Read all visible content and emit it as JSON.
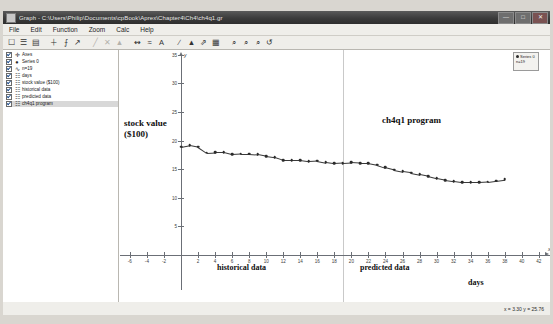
{
  "window": {
    "title": "Graph - C:\\Users\\Philip\\Documents\\cpBook\\Aprex\\Chapter4\\Ch4\\ch4q1.gr",
    "icon": "graph-window-icon",
    "buttons": {
      "minimize": "—",
      "maximize": "□",
      "close": "✕"
    }
  },
  "menu": {
    "items": [
      {
        "label": "File"
      },
      {
        "label": "Edit"
      },
      {
        "label": "Function"
      },
      {
        "label": "Zoom"
      },
      {
        "label": "Calc"
      },
      {
        "label": "Help"
      }
    ]
  },
  "toolbar": {
    "groups": [
      {
        "tools": [
          {
            "name": "new-icon",
            "glyph": "☐"
          },
          {
            "name": "open-icon",
            "glyph": "☰"
          },
          {
            "name": "save-icon",
            "glyph": "▤"
          }
        ]
      },
      {
        "tools": [
          {
            "name": "add-function-icon",
            "glyph": "＋"
          },
          {
            "name": "add-point-series-icon",
            "glyph": "⨍"
          },
          {
            "name": "add-relation-icon",
            "glyph": "↗"
          }
        ]
      },
      {
        "tools": [
          {
            "name": "edit-icon",
            "glyph": "╱",
            "dim": true
          },
          {
            "name": "delete-icon",
            "glyph": "✕",
            "dim": true
          },
          {
            "name": "properties-icon",
            "glyph": "▲",
            "dim": true
          }
        ]
      },
      {
        "tools": [
          {
            "name": "axes-icon",
            "glyph": "↭"
          },
          {
            "name": "grid-icon",
            "glyph": "≈"
          },
          {
            "name": "text-label-icon",
            "glyph": "A"
          }
        ]
      },
      {
        "tools": [
          {
            "name": "tangent-icon",
            "glyph": "∕"
          },
          {
            "name": "shade-area-icon",
            "glyph": "▲"
          },
          {
            "name": "trendline-icon",
            "glyph": "⇗"
          },
          {
            "name": "table-icon",
            "glyph": "▦"
          }
        ]
      },
      {
        "tools": [
          {
            "name": "zoom-in-icon",
            "glyph": "⌕"
          },
          {
            "name": "zoom-out-icon",
            "glyph": "⌕"
          },
          {
            "name": "zoom-window-icon",
            "glyph": "⌕"
          },
          {
            "name": "zoom-reset-icon",
            "glyph": "↺"
          }
        ]
      }
    ]
  },
  "tree": {
    "items": [
      {
        "label": "Axes",
        "glyph": "✛",
        "checked": true,
        "selected": false
      },
      {
        "label": "Series 0",
        "glyph": "●",
        "checked": true,
        "selected": false
      },
      {
        "label": "n=19",
        "glyph": "∿",
        "checked": true,
        "selected": false
      },
      {
        "label": "days",
        "glyph": "☷",
        "checked": true,
        "selected": false
      },
      {
        "label": "stock value ($100)",
        "glyph": "☷",
        "checked": true,
        "selected": false
      },
      {
        "label": "historical data",
        "glyph": "☷",
        "checked": true,
        "selected": false
      },
      {
        "label": "predicted data",
        "glyph": "☷",
        "checked": true,
        "selected": false
      },
      {
        "label": "ch4q1 program",
        "glyph": "☷",
        "checked": true,
        "selected": true
      }
    ]
  },
  "legend": {
    "series_label": "Series 0",
    "count_label": "n=19",
    "symbol": "point-marker-icon"
  },
  "annotations": {
    "ylabel_line1": "stock value",
    "ylabel_line2": "($100)",
    "program": "ch4q1 program",
    "historical": "historical data",
    "predicted": "predicted data",
    "days": "days"
  },
  "statusbar": {
    "coordinates": "x = 3.30   y = 25.76"
  },
  "chart_data": {
    "type": "scatter",
    "title": "",
    "xlabel": "days",
    "ylabel": "stock value ($100)",
    "xlim": [
      -7,
      43
    ],
    "ylim": [
      -4,
      37
    ],
    "grid": false,
    "legend_position": "top-right",
    "x_ticks": [
      -6,
      -4,
      -2,
      2,
      4,
      6,
      8,
      10,
      12,
      14,
      16,
      18,
      20,
      22,
      24,
      26,
      28,
      30,
      32,
      34,
      36,
      38,
      40,
      42
    ],
    "y_ticks": [
      5,
      10,
      15,
      20,
      25,
      30,
      35
    ],
    "axis_arrow_labels": {
      "x": "x",
      "y": "y"
    },
    "divider_x": 19,
    "series": [
      {
        "name": "Series 0",
        "marker": "circle",
        "connected": true,
        "x": [
          0,
          1,
          2,
          3,
          4,
          5,
          6,
          7,
          8,
          9,
          10,
          11,
          12,
          13,
          14,
          15,
          16,
          17,
          18,
          19,
          20,
          21,
          22,
          23,
          24,
          25,
          26,
          27,
          28,
          29,
          30,
          31,
          32,
          33,
          34,
          35,
          36,
          37,
          38
        ],
        "y": [
          18.9,
          19.2,
          18.9,
          17.9,
          18.0,
          18.0,
          17.6,
          17.7,
          17.7,
          17.6,
          17.3,
          17.1,
          16.6,
          16.6,
          16.6,
          16.4,
          16.5,
          16.2,
          16.0,
          16.1,
          16.2,
          16.1,
          16.1,
          15.8,
          15.3,
          14.9,
          14.6,
          14.4,
          14.1,
          13.8,
          13.4,
          13.1,
          12.9,
          12.7,
          12.7,
          12.7,
          12.8,
          13.0,
          13.2
        ]
      }
    ]
  }
}
